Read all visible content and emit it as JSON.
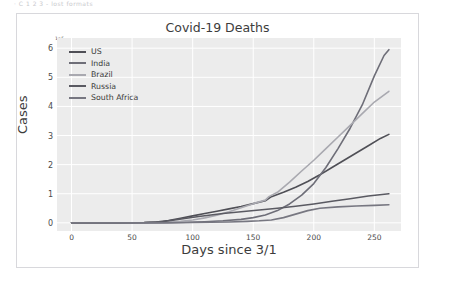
{
  "top_scrap_text": "· C 1 2 3 - lost formats",
  "chart_data": {
    "type": "line",
    "title": "Covid-19 Deaths",
    "xlabel": "Days since 3/1",
    "ylabel": "Cases",
    "y_offset_label": "1e5",
    "xlim": [
      -12,
      272
    ],
    "ylim": [
      -0.28,
      6.35
    ],
    "xticks": [
      0,
      50,
      100,
      150,
      200,
      250
    ],
    "yticks": [
      0,
      1,
      2,
      3,
      4,
      5,
      6
    ],
    "grid": true,
    "legend_position": "upper left",
    "background": "#ececec",
    "series": [
      {
        "name": "US",
        "color": "#4f4f56",
        "x": [
          0,
          20,
          40,
          60,
          70,
          80,
          90,
          100,
          110,
          120,
          130,
          140,
          150,
          160,
          165,
          175,
          185,
          195,
          205,
          215,
          225,
          235,
          245,
          255,
          262
        ],
        "values": [
          0.0,
          0.0,
          0.0,
          0.01,
          0.03,
          0.08,
          0.16,
          0.24,
          0.32,
          0.4,
          0.48,
          0.56,
          0.66,
          0.76,
          0.9,
          1.05,
          1.22,
          1.42,
          1.65,
          1.9,
          2.15,
          2.4,
          2.65,
          2.9,
          3.04
        ]
      },
      {
        "name": "India",
        "color": "#6e6e78",
        "x": [
          0,
          20,
          40,
          60,
          80,
          95,
          110,
          125,
          140,
          150,
          160,
          170,
          180,
          190,
          200,
          210,
          220,
          230,
          240,
          250,
          258,
          262
        ],
        "values": [
          0.0,
          0.0,
          0.0,
          0.0,
          0.01,
          0.02,
          0.04,
          0.07,
          0.12,
          0.18,
          0.27,
          0.42,
          0.65,
          0.95,
          1.35,
          1.9,
          2.55,
          3.25,
          4.05,
          5.05,
          5.75,
          5.95
        ]
      },
      {
        "name": "Brazil",
        "color": "#a9a9b0",
        "x": [
          0,
          20,
          40,
          60,
          80,
          90,
          100,
          110,
          120,
          130,
          140,
          150,
          160,
          163,
          170,
          180,
          190,
          200,
          210,
          220,
          230,
          240,
          250,
          262
        ],
        "values": [
          0.0,
          0.0,
          0.0,
          0.0,
          0.02,
          0.05,
          0.1,
          0.17,
          0.26,
          0.38,
          0.52,
          0.66,
          0.78,
          0.9,
          1.05,
          1.4,
          1.78,
          2.15,
          2.55,
          2.95,
          3.35,
          3.75,
          4.15,
          4.52
        ]
      },
      {
        "name": "Russia",
        "color": "#5a5a62",
        "x": [
          0,
          20,
          40,
          60,
          75,
          85,
          95,
          105,
          115,
          125,
          140,
          155,
          170,
          185,
          200,
          215,
          230,
          245,
          262
        ],
        "values": [
          0.0,
          0.0,
          0.0,
          0.01,
          0.04,
          0.1,
          0.16,
          0.22,
          0.27,
          0.32,
          0.38,
          0.44,
          0.5,
          0.57,
          0.65,
          0.74,
          0.83,
          0.92,
          1.0
        ]
      },
      {
        "name": "South Africa",
        "color": "#777781",
        "x": [
          0,
          20,
          40,
          60,
          80,
          100,
          115,
          130,
          145,
          155,
          165,
          175,
          185,
          195,
          205,
          220,
          235,
          250,
          262
        ],
        "values": [
          0.0,
          0.0,
          0.0,
          0.0,
          0.0,
          0.01,
          0.02,
          0.03,
          0.05,
          0.07,
          0.1,
          0.18,
          0.3,
          0.42,
          0.5,
          0.55,
          0.58,
          0.6,
          0.62
        ]
      }
    ]
  }
}
